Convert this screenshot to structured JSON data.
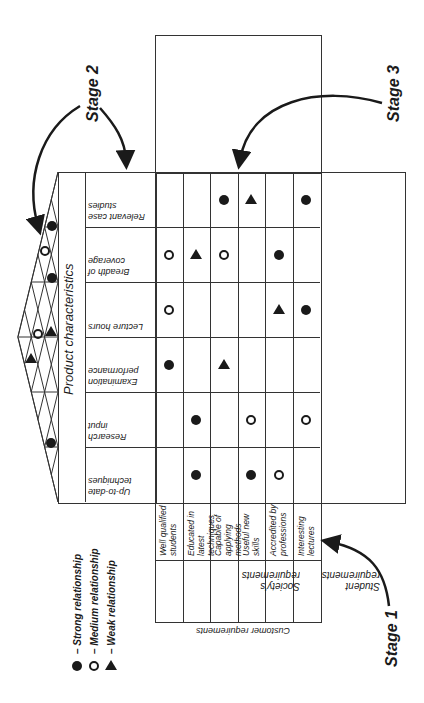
{
  "stages": {
    "stage1": "Stage 1",
    "stage2": "Stage 2",
    "stage3": "Stage 3"
  },
  "product_characteristics_label": "Product characteristics",
  "customer_requirements_label": "Customer requirements",
  "product_characteristics": [
    "Relevant case studies",
    "Breadth of coverage",
    "Lecture hours",
    "Examination performance",
    "Research input",
    "Up-to-date techniques"
  ],
  "requirement_groups": [
    {
      "label": "Society's requirements",
      "items": [
        "Well qualified students",
        "Educated in latest techniques",
        "Capable of applying methods"
      ]
    },
    {
      "label": "Student requirements",
      "items": [
        "Useful new skills",
        "Accredited by professions",
        "Interesting lectures"
      ]
    }
  ],
  "legend": [
    {
      "symbol": "strong",
      "label": "– Strong relationship"
    },
    {
      "symbol": "medium",
      "label": "– Medium relationship"
    },
    {
      "symbol": "weak",
      "label": "– Weak relationship"
    }
  ],
  "matrix": [
    [
      "",
      "",
      "strong",
      "weak",
      "",
      "strong"
    ],
    [
      "medium",
      "weak",
      "medium",
      "",
      "strong",
      ""
    ],
    [
      "medium",
      "",
      "",
      "",
      "weak",
      "strong"
    ],
    [
      "strong",
      "",
      "weak",
      "",
      "",
      ""
    ],
    [
      "",
      "strong",
      "",
      "medium",
      "",
      "medium"
    ],
    [
      "",
      "strong",
      "",
      "strong",
      "medium",
      ""
    ]
  ],
  "roof": [
    {
      "x": 52,
      "y": 226,
      "type": "strong"
    },
    {
      "x": 45,
      "y": 251,
      "type": "medium"
    },
    {
      "x": 52,
      "y": 278,
      "type": "strong"
    },
    {
      "x": 38,
      "y": 334,
      "type": "medium"
    },
    {
      "x": 51,
      "y": 332,
      "type": "weak"
    },
    {
      "x": 31,
      "y": 359,
      "type": "weak"
    },
    {
      "x": 51,
      "y": 443,
      "type": "strong"
    }
  ]
}
